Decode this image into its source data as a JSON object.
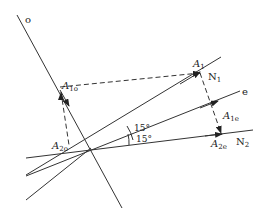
{
  "diagram": {
    "labels": {
      "o": "o",
      "A1o_main": "A",
      "A1o_sub": "1o",
      "A1_main": "A",
      "A1_sub": "1",
      "N1_main": "N",
      "N1_sub": "1",
      "e": "e",
      "A1e_main": "A",
      "A1e_sub": "1e",
      "A2o_main": "A",
      "A2o_sub": "2o",
      "A2e_main": "A",
      "A2e_sub": "2e",
      "N2_main": "N",
      "N2_sub": "2",
      "angle1": "15°",
      "angle2": "15°"
    },
    "colors": {
      "line": "#333333",
      "background": "#ffffff"
    }
  }
}
